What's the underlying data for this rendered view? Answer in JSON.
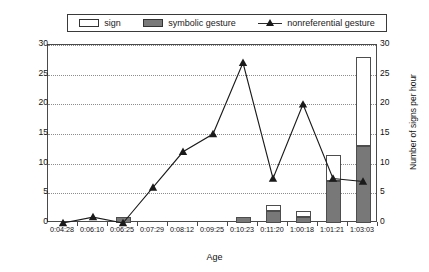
{
  "legend": {
    "items": [
      {
        "label": "sign",
        "marker": "open-bar-swatch"
      },
      {
        "label": "symbolic gesture",
        "marker": "filled-bar-swatch"
      },
      {
        "label": "nonreferential gesture",
        "marker": "line-triangle-marker"
      }
    ]
  },
  "axes": {
    "left_title": "Number of nonreferential gestures per hour",
    "right_title": "Number of signs per hour",
    "x_title": "Age",
    "y_ticks": [
      "0",
      "5",
      "10",
      "15",
      "20",
      "25",
      "30"
    ]
  },
  "chart_data": {
    "type": "bar",
    "title": "",
    "xlabel": "Age",
    "ylabel": "Number of nonreferential gestures per hour",
    "y2label": "Number of signs per hour",
    "ylim": [
      0,
      30
    ],
    "y2lim": [
      0,
      30
    ],
    "ytick_step": 5,
    "grid": true,
    "legend_position": "top",
    "categories": [
      "0:04:28",
      "0:06:10",
      "0:06:25",
      "0:07:29",
      "0:08:12",
      "0:09:25",
      "0:10:23",
      "0:11:20",
      "1:00:18",
      "1:01:21",
      "1:03:03"
    ],
    "series": [
      {
        "name": "sign",
        "type": "bar-stacked",
        "axis": "right",
        "color": "#ffffff",
        "values": [
          0,
          0,
          0,
          0,
          0,
          0,
          0,
          1,
          1,
          4.5,
          15
        ]
      },
      {
        "name": "symbolic gesture",
        "type": "bar-stacked",
        "axis": "right",
        "color": "#787878",
        "values": [
          0,
          0,
          1,
          0,
          0,
          0,
          1,
          2,
          1,
          7,
          13
        ]
      },
      {
        "name": "nonreferential gesture",
        "type": "line",
        "axis": "left",
        "color": "#1a1a1a",
        "marker": "triangle",
        "values": [
          0,
          1,
          0,
          6,
          12,
          15,
          27,
          7.5,
          20,
          7.5,
          7
        ]
      }
    ]
  }
}
